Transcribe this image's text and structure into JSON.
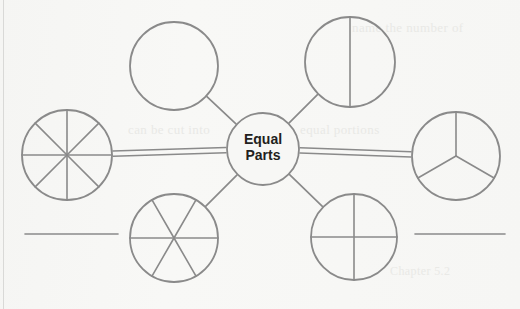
{
  "page": {
    "background_color": "#f7f7f5",
    "stroke_color": "#8a8a8a",
    "text_color": "#231f20",
    "ghost_color": "#e9e9e6",
    "width": 520,
    "height": 309
  },
  "center_node": {
    "name": "equal-parts-center",
    "line1": "Equal",
    "line2": "Parts",
    "cx": 263,
    "cy": 149,
    "r": 36
  },
  "nodes": [
    {
      "name": "circle-whole",
      "label": "whole",
      "parts": 1,
      "divider_style": "none",
      "cx": 174,
      "cy": 66,
      "r": 44
    },
    {
      "name": "circle-halves",
      "label": "halves",
      "parts": 2,
      "divider_style": "vertical",
      "cx": 350,
      "cy": 62,
      "r": 45
    },
    {
      "name": "circle-thirds",
      "label": "thirds",
      "parts": 3,
      "divider_style": "y-shape",
      "cx": 456,
      "cy": 156,
      "r": 44
    },
    {
      "name": "circle-fourths",
      "label": "fourths",
      "parts": 4,
      "divider_style": "cross",
      "cx": 354,
      "cy": 237,
      "r": 43
    },
    {
      "name": "circle-sixths",
      "label": "sixths",
      "parts": 6,
      "divider_style": "six-spoke",
      "cx": 174,
      "cy": 238,
      "r": 44
    },
    {
      "name": "circle-eighths",
      "label": "eighths",
      "parts": 8,
      "divider_style": "eight-spoke",
      "cx": 67,
      "cy": 155,
      "r": 45
    }
  ],
  "connectors": [
    {
      "name": "connector-center-to-whole",
      "style": "single"
    },
    {
      "name": "connector-center-to-halves",
      "style": "single"
    },
    {
      "name": "connector-center-to-thirds",
      "style": "double"
    },
    {
      "name": "connector-center-to-fourths",
      "style": "single"
    },
    {
      "name": "connector-center-to-sixths",
      "style": "single"
    },
    {
      "name": "connector-center-to-eighths",
      "style": "double"
    }
  ],
  "answer_lines": [
    {
      "name": "answer-line-left",
      "x1": 25,
      "x2": 118,
      "y": 234
    },
    {
      "name": "answer-line-right",
      "x1": 415,
      "x2": 505,
      "y": 234
    }
  ],
  "ghost_text": {
    "top_right": "name the number of",
    "mid_left": "can be cut into",
    "mid_right": "equal portions",
    "bottom": "Chapter 5.2"
  }
}
